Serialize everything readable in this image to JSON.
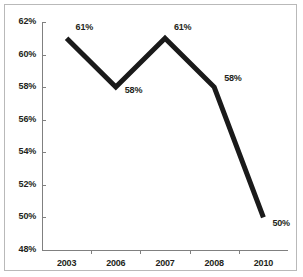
{
  "chart_data": {
    "type": "line",
    "title": "",
    "xlabel": "",
    "ylabel": "",
    "categories": [
      "2003",
      "2006",
      "2007",
      "2008",
      "2010"
    ],
    "values": [
      61,
      58,
      61,
      58,
      50
    ],
    "point_labels": [
      "61%",
      "58%",
      "61%",
      "58%",
      "50%"
    ],
    "ylim": [
      48,
      62
    ],
    "ytick_values": [
      62,
      60,
      58,
      56,
      54,
      52,
      50,
      48
    ],
    "ytick_labels": [
      "62%",
      "60%",
      "58%",
      "56%",
      "54%",
      "52%",
      "50%",
      "48%"
    ],
    "grid": false,
    "legend": false,
    "series": [
      {
        "name": "series-1",
        "values": [
          61,
          58,
          61,
          58,
          50
        ]
      }
    ],
    "colors": {
      "line": "#1a1a1a",
      "axis": "#808080",
      "text": "#231f20",
      "background": "#ffffff",
      "frame": "#b9b9b9"
    }
  }
}
